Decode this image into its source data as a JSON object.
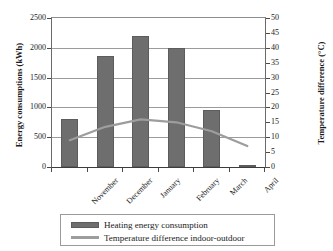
{
  "chart_data": {
    "type": "bar",
    "title": "",
    "categories": [
      "November",
      "December",
      "January",
      "February",
      "March",
      "April"
    ],
    "series": [
      {
        "name": "Heating energy consumption",
        "type": "bar",
        "axis": "left",
        "values": [
          800,
          1870,
          2200,
          2000,
          950,
          30
        ],
        "color": "#6e6e6e"
      },
      {
        "name": "Temperature difference indoor-outdoor",
        "type": "line",
        "axis": "right",
        "values": [
          9,
          13.5,
          16,
          15,
          12,
          7
        ],
        "color": "#9d9d9d"
      }
    ],
    "xlabel": "",
    "ylabel": "Energy consumptions (kWh)",
    "y2label": "Temperature difference (°C)",
    "ylim": [
      0,
      2500
    ],
    "y2lim": [
      0,
      50
    ],
    "yticks": [
      "0",
      "500",
      "1000",
      "1500",
      "2000",
      "2500"
    ],
    "y2ticks": [
      "0",
      "5",
      "10",
      "15",
      "20",
      "25",
      "30",
      "35",
      "40",
      "45",
      "50"
    ],
    "grid": true,
    "legend_position": "bottom"
  },
  "legend": {
    "items": [
      {
        "label": "Heating energy consumption",
        "marker": "bar-swatch"
      },
      {
        "label": "Temperature difference indoor-outdoor",
        "marker": "line-swatch"
      }
    ]
  }
}
